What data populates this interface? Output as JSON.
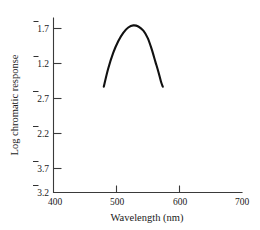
{
  "figure": {
    "background_color": "#ffffff",
    "axis_color": "#3a3a3a",
    "curve_color": "#111111"
  },
  "chart_data": {
    "type": "line",
    "title": "",
    "subtitle": "",
    "xlabel": "Wavelength (nm)",
    "ylabel": "Log chromatic response",
    "xlim": [
      400,
      700
    ],
    "ylim": [
      -3.2,
      -1.55
    ],
    "grid": false,
    "legend": null,
    "x_ticks": [
      400,
      500,
      600,
      700
    ],
    "x_tick_labels": [
      "400",
      "500",
      "600",
      "700"
    ],
    "y_ticks": [
      -1.7,
      -1.2,
      -2.7,
      -2.2,
      -3.7,
      -3.2
    ],
    "y_tick_labels": [
      "1.7",
      "1.2",
      "2.7",
      "2.2",
      "3.7",
      "3.2"
    ],
    "y_tick_overbar": [
      true,
      true,
      true,
      true,
      true,
      true
    ],
    "y_tick_note": "Overbar denotes a negative characteristic (bar notation), e.g. 1.7 reads as -1 + 0.7",
    "series": [
      {
        "name": "chromatic response",
        "x": [
          480,
          487,
          495,
          503,
          511,
          519,
          527,
          535,
          543,
          550,
          556,
          562,
          567,
          571,
          574
        ],
        "y": [
          -2.2,
          -2.03,
          -1.88,
          -1.77,
          -1.69,
          -1.64,
          -1.62,
          -1.63,
          -1.67,
          -1.74,
          -1.84,
          -1.96,
          -2.06,
          -2.15,
          -2.2
        ]
      }
    ],
    "annotations": []
  }
}
